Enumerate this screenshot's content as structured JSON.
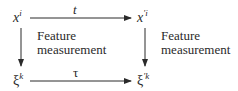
{
  "diagram": {
    "nodes": {
      "top_left": {
        "base": "x",
        "sup": "i"
      },
      "top_right": {
        "base": "x",
        "sup": "′i"
      },
      "bottom_left": {
        "base": "ξ",
        "sup": "k"
      },
      "bottom_right": {
        "base": "ξ",
        "sup": "′k"
      }
    },
    "edges": {
      "top": {
        "label": "t",
        "from": "top_left",
        "to": "top_right"
      },
      "bottom": {
        "label": "τ",
        "from": "bottom_left",
        "to": "bottom_right"
      },
      "left": {
        "label_line1": "Feature",
        "label_line2": "measurement",
        "from": "top_left",
        "to": "bottom_left"
      },
      "right": {
        "label_line1": "Feature",
        "label_line2": "measurement",
        "from": "top_right",
        "to": "bottom_right"
      }
    },
    "colors": {
      "stroke": "#2a2a2a",
      "background": "#ffffff"
    }
  }
}
